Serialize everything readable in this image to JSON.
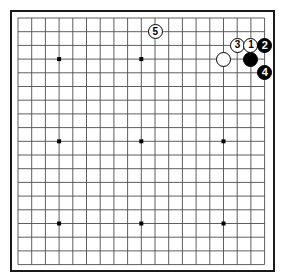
{
  "diagram": {
    "kind": "go-board-diagram",
    "board_size": 19,
    "background_color": "#ffffff",
    "line_color": "#4d4d4d",
    "border_color": "#1a1a1a",
    "black_color": "#000000",
    "white_color": "#ffffff",
    "geometry": {
      "origin_x": 18,
      "origin_y": 18,
      "pitch": 13.7,
      "stone_diameter": 15,
      "star_point_size": 4
    },
    "star_points": [
      {
        "col": 4,
        "row": 4
      },
      {
        "col": 10,
        "row": 4
      },
      {
        "col": 16,
        "row": 4
      },
      {
        "col": 4,
        "row": 10
      },
      {
        "col": 10,
        "row": 10
      },
      {
        "col": 16,
        "row": 10
      },
      {
        "col": 4,
        "row": 16
      },
      {
        "col": 10,
        "row": 16
      },
      {
        "col": 16,
        "row": 16
      }
    ],
    "stones": [
      {
        "id": "stone-white-plain",
        "color": "white",
        "label": "",
        "col": 16,
        "row": 4
      },
      {
        "id": "stone-black-plain",
        "color": "black",
        "label": "",
        "col": 18,
        "row": 4
      },
      {
        "id": "stone-move-3",
        "color": "white",
        "label": "3",
        "col": 17,
        "row": 3
      },
      {
        "id": "stone-move-1",
        "color": "white",
        "label": "1",
        "col": 18,
        "row": 3
      },
      {
        "id": "stone-move-2",
        "color": "black",
        "label": "2",
        "col": 19,
        "row": 3
      },
      {
        "id": "stone-move-4",
        "color": "black",
        "label": "4",
        "col": 19,
        "row": 5
      },
      {
        "id": "stone-move-5",
        "color": "white",
        "label": "5",
        "col": 11,
        "row": 2
      }
    ]
  }
}
